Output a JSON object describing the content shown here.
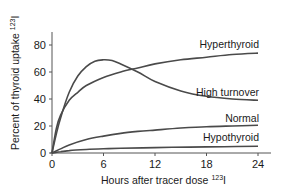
{
  "chart_data": {
    "type": "line",
    "title": "",
    "xlabel": "Hours after tracer dose",
    "xlabel_sup": "123",
    "xlabel_suffix": "I",
    "ylabel": "Percent of thyroid uptake",
    "ylabel_sup": "123",
    "ylabel_suffix": "I",
    "xlim": [
      0,
      24
    ],
    "ylim": [
      0,
      80
    ],
    "xticks": [
      0,
      6,
      12,
      18,
      24
    ],
    "yticks": [
      0,
      20,
      40,
      60,
      80
    ],
    "grid": false,
    "legend": "inline labels at right end of curves",
    "line_color": "#4a4a4a",
    "series": [
      {
        "name": "Hyperthyroid",
        "x": [
          0,
          0.5,
          1,
          2,
          3,
          4,
          6,
          8,
          10,
          12,
          15,
          18,
          21,
          24
        ],
        "values": [
          0,
          18,
          28,
          39,
          45,
          50,
          56,
          60,
          63,
          66,
          69,
          71,
          73,
          74
        ]
      },
      {
        "name": "High turnover",
        "x": [
          0,
          0.5,
          1,
          2,
          3,
          4,
          5,
          6,
          7,
          8,
          10,
          12,
          15,
          18,
          21,
          24
        ],
        "values": [
          0,
          14,
          26,
          45,
          57,
          64,
          68,
          69,
          68.5,
          66,
          60,
          53,
          46,
          42,
          40,
          39
        ]
      },
      {
        "name": "Normal",
        "x": [
          0,
          1,
          2,
          4,
          6,
          8,
          10,
          12,
          15,
          18,
          21,
          24
        ],
        "values": [
          0,
          3,
          6,
          10,
          12.5,
          14.5,
          16,
          17,
          18.5,
          19.5,
          20,
          20.5
        ]
      },
      {
        "name": "Hypothyroid",
        "x": [
          0,
          1,
          2,
          4,
          6,
          8,
          12,
          16,
          20,
          24
        ],
        "values": [
          0,
          1,
          1.8,
          2.6,
          3.1,
          3.5,
          4,
          4.4,
          4.7,
          5
        ]
      }
    ]
  }
}
